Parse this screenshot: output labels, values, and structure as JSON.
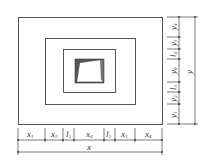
{
  "diagram": {
    "type": "nested-rectangles-dimensioned",
    "stroke_color": "#444444",
    "fill_core": "#555555",
    "rectangles": [
      {
        "name": "outer",
        "x": 18,
        "y": 17,
        "w": 144,
        "h": 107
      },
      {
        "name": "middle",
        "x": 45,
        "y": 38,
        "w": 90,
        "h": 66
      },
      {
        "name": "inner",
        "x": 63,
        "y": 49,
        "w": 52,
        "h": 43
      },
      {
        "name": "core",
        "x": 75,
        "y": 59,
        "w": 28,
        "h": 23
      }
    ],
    "x_dimensions": {
      "segments": [
        {
          "label": "x",
          "sub": "1"
        },
        {
          "label": "x",
          "sub": "2"
        },
        {
          "label": "l",
          "sub": "1"
        },
        {
          "label": "x",
          "sub": "0"
        },
        {
          "label": "l",
          "sub": "2"
        },
        {
          "label": "x",
          "sub": "3"
        },
        {
          "label": "x",
          "sub": "4"
        }
      ],
      "total_label": "x"
    },
    "y_dimensions": {
      "segments": [
        {
          "label": "y",
          "sub": "4"
        },
        {
          "label": "y",
          "sub": "3"
        },
        {
          "label": "l",
          "sub": "4"
        },
        {
          "label": "y",
          "sub": "0"
        },
        {
          "label": "l",
          "sub": "3"
        },
        {
          "label": "y",
          "sub": "2"
        },
        {
          "label": "y",
          "sub": "1"
        }
      ],
      "total_label": "y"
    }
  }
}
